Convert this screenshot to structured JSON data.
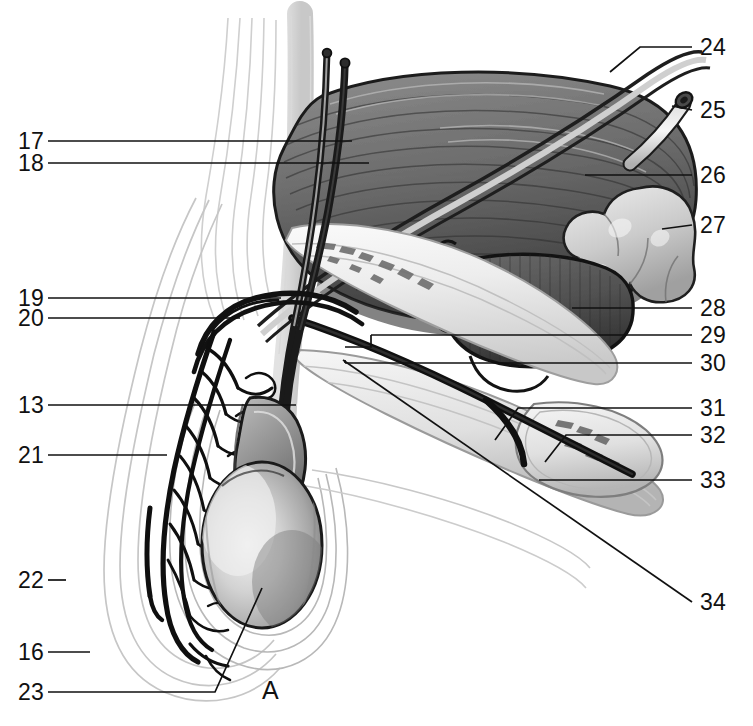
{
  "figure": {
    "panel_letter": "A",
    "background_color": "#ffffff",
    "ink_color": "#111111",
    "width": 753,
    "height": 726
  },
  "labels": {
    "left": [
      {
        "id": "17",
        "text": "17",
        "x": 18,
        "y": 141,
        "leader_to_x": 352,
        "leader_to_y": 141
      },
      {
        "id": "18",
        "text": "18",
        "x": 18,
        "y": 163,
        "leader_to_x": 369,
        "leader_to_y": 163
      },
      {
        "id": "19",
        "text": "19",
        "x": 18,
        "y": 298,
        "leader_to_x": 281,
        "leader_to_y": 298
      },
      {
        "id": "20",
        "text": "20",
        "x": 18,
        "y": 318,
        "leader_to_x": 240,
        "leader_to_y": 318
      },
      {
        "id": "13",
        "text": "13",
        "x": 18,
        "y": 405,
        "leader_to_x": 296,
        "leader_to_y": 405
      },
      {
        "id": "21",
        "text": "21",
        "x": 18,
        "y": 455,
        "leader_to_x": 167,
        "leader_to_y": 455
      },
      {
        "id": "22",
        "text": "22",
        "x": 18,
        "y": 580,
        "leader_to_x": 66,
        "leader_to_y": 580
      },
      {
        "id": "16",
        "text": "16",
        "x": 18,
        "y": 652,
        "leader_to_x": 90,
        "leader_to_y": 652
      },
      {
        "id": "23",
        "text": "23",
        "x": 18,
        "y": 692,
        "leader_to_x": 262,
        "leader_to_y": 588
      }
    ],
    "right": [
      {
        "id": "24",
        "text": "24",
        "x": 700,
        "y": 47,
        "leader_to_x": 610,
        "leader_to_y": 72
      },
      {
        "id": "25",
        "text": "25",
        "x": 700,
        "y": 110,
        "leader_to_x": 683,
        "leader_to_y": 103
      },
      {
        "id": "26",
        "text": "26",
        "x": 700,
        "y": 175,
        "leader_to_x": 585,
        "leader_to_y": 175
      },
      {
        "id": "27",
        "text": "27",
        "x": 700,
        "y": 225,
        "leader_to_x": 665,
        "leader_to_y": 228
      },
      {
        "id": "28",
        "text": "28",
        "x": 700,
        "y": 308,
        "leader_to_x": 572,
        "leader_to_y": 308
      },
      {
        "id": "29",
        "text": "29",
        "x": 700,
        "y": 335,
        "leader_to_x": 371,
        "leader_to_y": 335
      },
      {
        "id": "30",
        "text": "30",
        "x": 700,
        "y": 363,
        "leader_to_x": 345,
        "leader_to_y": 363
      },
      {
        "id": "31",
        "text": "31",
        "x": 700,
        "y": 408,
        "leader_to_x": 550,
        "leader_to_y": 408
      },
      {
        "id": "32",
        "text": "32",
        "x": 700,
        "y": 435,
        "leader_to_x": 592,
        "leader_to_y": 435
      },
      {
        "id": "33",
        "text": "33",
        "x": 700,
        "y": 480,
        "leader_to_x": 539,
        "leader_to_y": 480
      },
      {
        "id": "34",
        "text": "34",
        "x": 700,
        "y": 602,
        "leader_to_x": 343,
        "leader_to_y": 360
      }
    ]
  }
}
